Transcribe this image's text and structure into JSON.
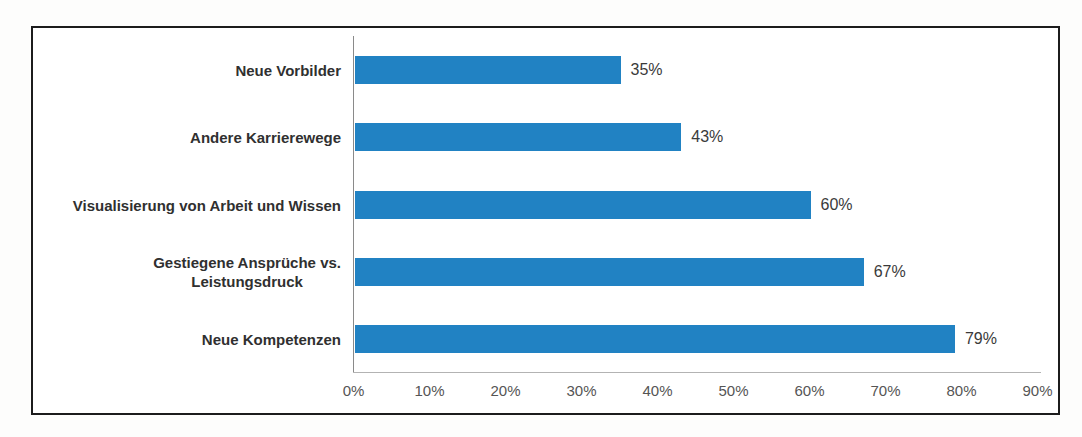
{
  "chart_data": {
    "type": "bar",
    "orientation": "horizontal",
    "title": "",
    "categories": [
      "Neue Vorbilder",
      "Andere Karrierewege",
      "Visualisierung von Arbeit und Wissen",
      "Gestiegene Ansprüche vs. Leistungsdruck",
      "Neue Kompetenzen"
    ],
    "category_display_lines": [
      [
        "Neue Vorbilder"
      ],
      [
        "Andere Karrierewege"
      ],
      [
        "Visualisierung von Arbeit und Wissen"
      ],
      [
        "Gestiegene Ansprüche vs.",
        "Leistungsdruck"
      ],
      [
        "Neue Kompetenzen"
      ]
    ],
    "values": [
      35,
      43,
      60,
      67,
      79
    ],
    "value_labels": [
      "35%",
      "43%",
      "60%",
      "67%",
      "79%"
    ],
    "xlabel": "",
    "ylabel": "",
    "xlim": [
      0,
      90
    ],
    "x_tick_step": 10,
    "x_tick_labels": [
      "0%",
      "10%",
      "20%",
      "30%",
      "40%",
      "50%",
      "60%",
      "70%",
      "80%",
      "90%"
    ],
    "grid": false,
    "legend": null,
    "colors": {
      "bar": "#2182c3",
      "category_label": "#303030",
      "value_label": "#3a3a3a",
      "tick_label": "#555555",
      "y_axis_line": "#8a8a8a",
      "x_axis_line": "#b3b3b3",
      "frame_border": "#1c1c1c",
      "plot_background": "#ffffff"
    }
  }
}
